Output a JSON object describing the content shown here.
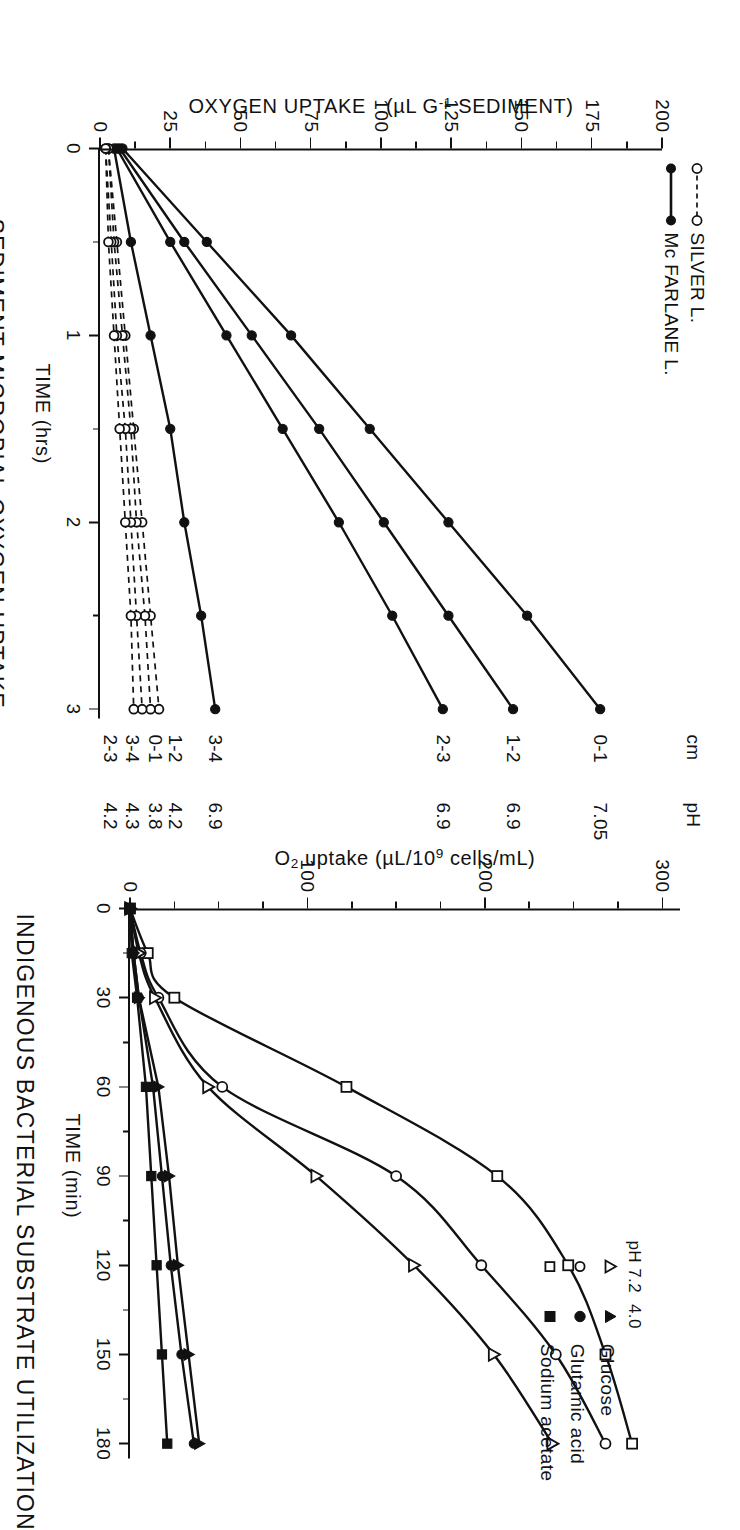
{
  "figure": {
    "orientation": "page rotated 90 degrees (landscape figure on portrait page)"
  },
  "left_panel": {
    "title": "SEDIMENT MICROBIAL OXYGEN UPTAKE",
    "xlabel": "TIME  (hrs)",
    "ylabel_part1": "OXYGEN UPTAKE",
    "ylabel_part2": "(µL G",
    "ylabel_sup": "-1",
    "ylabel_part3": " SEDIMENT)",
    "xticks": [
      "0",
      "1",
      "2",
      "3"
    ],
    "yticks": [
      "0",
      "25",
      "50",
      "75",
      "100",
      "125",
      "150",
      "175",
      "200"
    ],
    "legend": [
      {
        "label": "SILVER L.",
        "marker": "open-circle",
        "line": "dashed"
      },
      {
        "label": "Mc FARLANE L.",
        "marker": "filled-circle",
        "line": "solid"
      }
    ],
    "col_header_cm": "cm",
    "col_header_ph": "pH",
    "series_labels": [
      {
        "cm": "0-1",
        "ph": "7.05"
      },
      {
        "cm": "1-2",
        "ph": "6.9"
      },
      {
        "cm": "2-3",
        "ph": "6.9"
      },
      {
        "cm": "3-4",
        "ph": "6.9"
      },
      {
        "cm": "1-2",
        "ph": "4.2"
      },
      {
        "cm": "0-1",
        "ph": "3.8"
      },
      {
        "cm": "3-4",
        "ph": "4.3"
      },
      {
        "cm": "2-3",
        "ph": "4.2"
      }
    ]
  },
  "right_panel": {
    "title": "INDIGENOUS BACTERIAL SUBSTRATE UTILIZATION",
    "xlabel": "TIME  (min)",
    "ylabel_part1": "O",
    "ylabel_sub1": "2",
    "ylabel_part2": " uptake  (µL/10",
    "ylabel_sup": "9",
    "ylabel_part3": " cells/mL)",
    "xticks": [
      "0",
      "30",
      "60",
      "90",
      "120",
      "150",
      "180"
    ],
    "yticks": [
      "0",
      "100",
      "200",
      "300"
    ],
    "legend_header_left": "pH 7.2",
    "legend_header_right": "4.0",
    "legend_rows": [
      {
        "label": "Glucose",
        "open": "open-triangle",
        "filled": "filled-triangle"
      },
      {
        "label": "Glutamic acid",
        "open": "open-circle",
        "filled": "filled-circle"
      },
      {
        "label": "Sodium acetate",
        "open": "open-square",
        "filled": "filled-square"
      }
    ]
  },
  "chart_data": [
    {
      "id": "sediment-microbial-oxygen-uptake",
      "type": "line",
      "title": "SEDIMENT MICROBIAL OXYGEN UPTAKE",
      "xlabel": "TIME (hrs)",
      "ylabel": "OXYGEN UPTAKE (µL G-1 SEDIMENT)",
      "xlim": [
        0,
        3.05
      ],
      "ylim": [
        0,
        200
      ],
      "xticks": [
        0,
        1,
        2,
        3
      ],
      "yticks": [
        0,
        25,
        50,
        75,
        100,
        125,
        150,
        175,
        200
      ],
      "grid": false,
      "legend": [
        "SILVER L.",
        "Mc FARLANE L."
      ],
      "legend_position": "upper-left",
      "series": [
        {
          "name": "Mc FARLANE L. 0-1 cm (pH 7.05)",
          "lake": "Mc FARLANE L.",
          "cm": "0-1",
          "ph": 7.05,
          "marker": "filled-circle",
          "line": "solid",
          "x": [
            0,
            0.5,
            1.0,
            1.5,
            2.0,
            2.5,
            3.0
          ],
          "y": [
            8,
            38,
            68,
            96,
            124,
            152,
            178
          ]
        },
        {
          "name": "Mc FARLANE L. 1-2 cm (pH 6.9)",
          "lake": "Mc FARLANE L.",
          "cm": "1-2",
          "ph": 6.9,
          "marker": "filled-circle",
          "line": "solid",
          "x": [
            0,
            0.5,
            1.0,
            1.5,
            2.0,
            2.5,
            3.0
          ],
          "y": [
            7,
            30,
            54,
            78,
            101,
            124,
            147
          ]
        },
        {
          "name": "Mc FARLANE L. 2-3 cm (pH 6.9)",
          "lake": "Mc FARLANE L.",
          "cm": "2-3",
          "ph": 6.9,
          "marker": "filled-circle",
          "line": "solid",
          "x": [
            0,
            0.5,
            1.0,
            1.5,
            2.0,
            2.5,
            3.0
          ],
          "y": [
            6,
            25,
            45,
            65,
            85,
            104,
            122
          ]
        },
        {
          "name": "Mc FARLANE L. 3-4 cm (pH 6.9)",
          "lake": "Mc FARLANE L.",
          "cm": "3-4",
          "ph": 6.9,
          "marker": "filled-circle",
          "line": "solid",
          "x": [
            0,
            0.5,
            1.0,
            1.5,
            2.0,
            2.5,
            3.0
          ],
          "y": [
            5,
            11,
            18,
            25,
            30,
            36,
            41
          ]
        },
        {
          "name": "SILVER L. 1-2 cm (pH 4.2)",
          "lake": "SILVER L.",
          "cm": "1-2",
          "ph": 4.2,
          "marker": "open-circle",
          "line": "dashed",
          "x": [
            0,
            0.5,
            1.0,
            1.5,
            2.0,
            2.5,
            3.0
          ],
          "y": [
            3,
            6,
            9,
            12,
            15,
            18,
            21
          ]
        },
        {
          "name": "SILVER L. 0-1 cm (pH 3.8)",
          "lake": "SILVER L.",
          "cm": "0-1",
          "ph": 3.8,
          "marker": "open-circle",
          "line": "dashed",
          "x": [
            0,
            0.5,
            1.0,
            1.5,
            2.0,
            2.5,
            3.0
          ],
          "y": [
            3,
            5,
            8,
            11,
            13,
            16,
            18
          ]
        },
        {
          "name": "SILVER L. 3-4 cm (pH 4.3)",
          "lake": "SILVER L.",
          "cm": "3-4",
          "ph": 4.3,
          "marker": "open-circle",
          "line": "dashed",
          "x": [
            0,
            0.5,
            1.0,
            1.5,
            2.0,
            2.5,
            3.0
          ],
          "y": [
            2,
            4,
            6,
            9,
            11,
            13,
            15
          ]
        },
        {
          "name": "SILVER L. 2-3 cm (pH 4.2)",
          "lake": "SILVER L.",
          "cm": "2-3",
          "ph": 4.2,
          "marker": "open-circle",
          "line": "dashed",
          "x": [
            0,
            0.5,
            1.0,
            1.5,
            2.0,
            2.5,
            3.0
          ],
          "y": [
            2,
            3,
            5,
            7,
            9,
            11,
            12
          ]
        }
      ]
    },
    {
      "id": "indigenous-bacterial-substrate-utilization",
      "type": "line",
      "title": "INDIGENOUS BACTERIAL SUBSTRATE UTILIZATION",
      "xlabel": "TIME (min)",
      "ylabel": "O2 uptake (µL/10^9 cells/mL)",
      "xlim": [
        0,
        185
      ],
      "ylim": [
        0,
        310
      ],
      "xticks": [
        0,
        30,
        60,
        90,
        120,
        150,
        180
      ],
      "yticks": [
        0,
        100,
        200,
        300
      ],
      "grid": false,
      "legend_position": "upper-right",
      "series": [
        {
          "name": "Sodium acetate pH 7.2",
          "substrate": "Sodium acetate",
          "ph": 7.2,
          "marker": "open-square",
          "line": "solid",
          "x": [
            0,
            15,
            30,
            60,
            90,
            120,
            150,
            180
          ],
          "y": [
            0,
            10,
            25,
            122,
            207,
            247,
            268,
            283
          ]
        },
        {
          "name": "Glutamic acid pH 7.2",
          "substrate": "Glutamic acid",
          "ph": 7.2,
          "marker": "open-circle",
          "line": "solid",
          "x": [
            0,
            15,
            30,
            60,
            90,
            120,
            150,
            180
          ],
          "y": [
            0,
            6,
            16,
            52,
            150,
            198,
            240,
            268
          ]
        },
        {
          "name": "Glucose pH 7.2",
          "substrate": "Glucose",
          "ph": 7.2,
          "marker": "open-triangle",
          "line": "solid",
          "x": [
            0,
            15,
            30,
            60,
            90,
            120,
            150,
            180
          ],
          "y": [
            0,
            5,
            14,
            44,
            105,
            160,
            205,
            238
          ]
        },
        {
          "name": "Glucose pH 4.0",
          "substrate": "Glucose",
          "ph": 4.0,
          "marker": "filled-triangle",
          "line": "solid",
          "x": [
            0,
            15,
            30,
            60,
            90,
            120,
            150,
            180
          ],
          "y": [
            0,
            2,
            5,
            16,
            22,
            27,
            33,
            39
          ]
        },
        {
          "name": "Glutamic acid pH 4.0",
          "substrate": "Glutamic acid",
          "ph": 4.0,
          "marker": "filled-circle",
          "line": "solid",
          "x": [
            0,
            15,
            30,
            60,
            90,
            120,
            150,
            180
          ],
          "y": [
            0,
            2,
            5,
            13,
            18,
            23,
            29,
            36
          ]
        },
        {
          "name": "Sodium acetate pH 4.0",
          "substrate": "Sodium acetate",
          "ph": 4.0,
          "marker": "filled-square",
          "line": "solid",
          "x": [
            0,
            15,
            30,
            60,
            90,
            120,
            150,
            180
          ],
          "y": [
            0,
            1,
            4,
            9,
            12,
            15,
            18,
            21
          ]
        }
      ]
    }
  ]
}
